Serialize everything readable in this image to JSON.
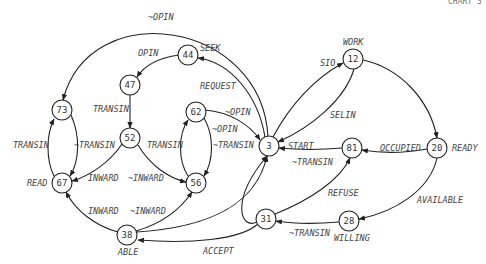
{
  "diagram": {
    "type": "state-transition-graph",
    "corner_label": "CHART 3",
    "nodes": [
      {
        "id": "3",
        "label": "3",
        "name": "",
        "x": 269,
        "y": 146
      },
      {
        "id": "12",
        "label": "12",
        "name": "WORK",
        "x": 353,
        "y": 59
      },
      {
        "id": "20",
        "label": "20",
        "name": "READY",
        "x": 437,
        "y": 148
      },
      {
        "id": "28",
        "label": "28",
        "name": "WILLING",
        "x": 349,
        "y": 221
      },
      {
        "id": "31",
        "label": "31",
        "name": "",
        "x": 266,
        "y": 219
      },
      {
        "id": "38",
        "label": "38",
        "name": "ABLE",
        "x": 127,
        "y": 235
      },
      {
        "id": "44",
        "label": "44",
        "name": "",
        "x": 188,
        "y": 55
      },
      {
        "id": "47",
        "label": "47",
        "name": "",
        "x": 130,
        "y": 85
      },
      {
        "id": "52",
        "label": "52",
        "name": "",
        "x": 130,
        "y": 138
      },
      {
        "id": "56",
        "label": "56",
        "name": "",
        "x": 196,
        "y": 183
      },
      {
        "id": "62",
        "label": "62",
        "name": "",
        "x": 196,
        "y": 112
      },
      {
        "id": "67",
        "label": "67",
        "name": "READ",
        "x": 62,
        "y": 183
      },
      {
        "id": "73",
        "label": "73",
        "name": "",
        "x": 62,
        "y": 110
      },
      {
        "id": "81",
        "label": "81",
        "name": "",
        "x": 352,
        "y": 148
      }
    ],
    "node_names": {
      "n12": "WORK",
      "n20": "READY",
      "n28": "WILLING",
      "n38": "ABLE",
      "n67": "READ",
      "n44": "SEEK"
    },
    "edges": [
      {
        "from": "3",
        "to": "73",
        "label": "~OPIN"
      },
      {
        "from": "3",
        "to": "44",
        "label": "REQUEST"
      },
      {
        "from": "44",
        "to": "47",
        "label": "OPIN"
      },
      {
        "from": "47",
        "to": "52",
        "label": "TRANSIN"
      },
      {
        "from": "52",
        "to": "67",
        "label": "INWARD"
      },
      {
        "from": "52",
        "to": "56",
        "label": "~INWARD"
      },
      {
        "from": "73",
        "to": "67",
        "label": "~TRANSIN"
      },
      {
        "from": "67",
        "to": "73",
        "label": "TRANSIN"
      },
      {
        "from": "62",
        "to": "3",
        "label": "~OPIN"
      },
      {
        "from": "62",
        "to": "56",
        "label": "~TRANSIN"
      },
      {
        "from": "56",
        "to": "62",
        "label": "TRANSIN"
      },
      {
        "from": "3",
        "to": "62",
        "label": "~OPIN"
      },
      {
        "from": "38",
        "to": "67",
        "label": "INWARD"
      },
      {
        "from": "38",
        "to": "56",
        "label": "~INWARD"
      },
      {
        "from": "38",
        "to": "3",
        "label": ""
      },
      {
        "from": "3",
        "to": "12",
        "label": "SIO"
      },
      {
        "from": "12",
        "to": "3",
        "label": "SELIN"
      },
      {
        "from": "12",
        "to": "20",
        "label": ""
      },
      {
        "from": "81",
        "to": "3",
        "label": "~TRANSIN"
      },
      {
        "from": "20",
        "to": "81",
        "label": "OCCUPIED"
      },
      {
        "from": "20",
        "to": "28",
        "label": "AVAILABLE"
      },
      {
        "from": "28",
        "to": "31",
        "label": "~TRANSIN"
      },
      {
        "from": "31",
        "to": "81",
        "label": "REFUSE"
      },
      {
        "from": "31",
        "to": "38",
        "label": "ACCEPT"
      },
      {
        "from": "31",
        "to": "3",
        "label": "START"
      }
    ],
    "edge_labels": {
      "opin_top": "~OPIN",
      "request": "REQUEST",
      "seek": "SEEK",
      "opin": "OPIN",
      "transin_47_52": "TRANSIN",
      "transin_67_73": "TRANSIN",
      "ntransin_73_67": "~TRANSIN",
      "transin_56_62": "TRANSIN",
      "ntransin_62_56": "~TRANSIN",
      "nopin_62_3": "~OPIN",
      "nopin_3_62": "~OPIN",
      "inward_52_67": "INWARD",
      "ninward_52_56": "~INWARD",
      "inward_38_67": "INWARD",
      "ninward_38_56": "~INWARD",
      "sio": "SIO",
      "selin": "SELIN",
      "start": "START",
      "ntransin_81_3": "~TRANSIN",
      "occupied": "OCCUPIED",
      "available": "AVAILABLE",
      "refuse": "REFUSE",
      "ntransin_28_31": "~TRANSIN",
      "accept": "ACCEPT"
    }
  }
}
